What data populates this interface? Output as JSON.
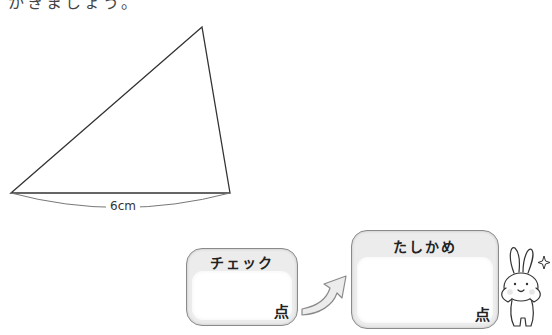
{
  "instruction": {
    "text": "かきましょう。",
    "clipped": true
  },
  "figure": {
    "shape": "triangle",
    "vertices": [
      [
        11,
        193
      ],
      [
        202,
        27
      ],
      [
        230,
        193
      ]
    ],
    "base_length_label": "6cm",
    "stroke_color": "#333333"
  },
  "score_boxes": [
    {
      "title": "チェック",
      "unit": "点",
      "value": ""
    },
    {
      "title": "たしかめ",
      "unit": "点",
      "value": ""
    }
  ],
  "arrow": {
    "from": "チェック",
    "to": "たしかめ",
    "fill": "#e8e8e8",
    "stroke": "#888888"
  },
  "mascot": {
    "type": "rabbit-illustration",
    "sparkle": true
  }
}
